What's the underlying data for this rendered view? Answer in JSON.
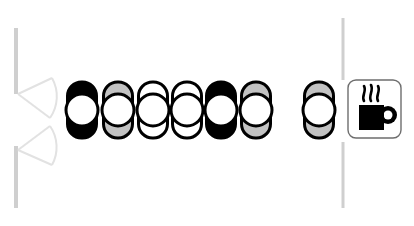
{
  "diagram": {
    "type": "architectural-floor-plan",
    "canvas": {
      "width": 414,
      "height": 226
    },
    "background_color": "#ffffff"
  },
  "colors": {
    "outline": "#000000",
    "seat_filled": "#000000",
    "seat_shaded": "#c2c2c2",
    "seat_empty": "#ffffff",
    "wall": "#cfcfcf",
    "door_arc": "#e2e2e2",
    "box_border": "#6e6e6e",
    "icon": "#000000"
  },
  "walls": {
    "label": "wall segments",
    "segments": [
      {
        "name": "left-wall-upper",
        "x": 16,
        "y1": 28,
        "y2": 94,
        "width": 4,
        "color": "#cfcfcf"
      },
      {
        "name": "left-wall-lower",
        "x": 16,
        "y1": 146,
        "y2": 208,
        "width": 4,
        "color": "#cfcfcf"
      },
      {
        "name": "right-wall-upper",
        "x": 343,
        "y1": 18,
        "y2": 80,
        "width": 3,
        "color": "#cfcfcf"
      },
      {
        "name": "right-wall-lower",
        "x": 343,
        "y1": 142,
        "y2": 208,
        "width": 3,
        "color": "#cfcfcf"
      }
    ]
  },
  "doors": {
    "label": "double door with swing arcs",
    "count": 2,
    "leaves": [
      {
        "name": "door-leaf-upper",
        "hinge_x": 18,
        "hinge_y": 94,
        "leaf_end_x": 52,
        "leaf_end_y": 78,
        "arc_end_x": 50,
        "arc_end_y": 118
      },
      {
        "name": "door-leaf-lower",
        "hinge_x": 18,
        "hinge_y": 150,
        "leaf_end_x": 52,
        "leaf_end_y": 165,
        "arc_end_x": 50,
        "arc_end_y": 126
      }
    ]
  },
  "seating": {
    "label": "Seating row",
    "total_seats": 7,
    "occupied_count": 2,
    "shaded_count": 3,
    "empty_count": 2,
    "seat_geometry": {
      "body_width": 29,
      "body_height": 56,
      "body_radius": 14,
      "head_radius": 16,
      "stroke": 3
    },
    "seats": [
      {
        "id": 1,
        "name": "seat-1",
        "cx": 82,
        "cy": 110,
        "fill": "#000000",
        "state": "occupied"
      },
      {
        "id": 2,
        "name": "seat-2",
        "cx": 118,
        "cy": 110,
        "fill": "#c2c2c2",
        "state": "shaded"
      },
      {
        "id": 3,
        "name": "seat-3",
        "cx": 153,
        "cy": 110,
        "fill": "#ffffff",
        "state": "empty"
      },
      {
        "id": 4,
        "name": "seat-4",
        "cx": 187,
        "cy": 110,
        "fill": "#ffffff",
        "state": "empty"
      },
      {
        "id": 5,
        "name": "seat-5",
        "cx": 221,
        "cy": 110,
        "fill": "#000000",
        "state": "occupied"
      },
      {
        "id": 6,
        "name": "seat-6",
        "cx": 256,
        "cy": 110,
        "fill": "#c2c2c2",
        "state": "shaded"
      },
      {
        "id": 7,
        "name": "seat-7",
        "cx": 319,
        "cy": 110,
        "fill": "#c2c2c2",
        "state": "shaded"
      }
    ]
  },
  "coffee_station": {
    "name": "coffee-station",
    "label": "Coffee station",
    "icon": "coffee-cup-icon",
    "box": {
      "x": 348,
      "y": 80,
      "width": 53,
      "height": 58,
      "radius": 8,
      "border_color": "#6e6e6e",
      "fill": "#ffffff"
    },
    "cup": {
      "body_x": 359,
      "body_y": 105,
      "body_width": 25,
      "body_height": 25,
      "handle_cx": 388,
      "handle_cy": 115,
      "handle_outer_r": 9,
      "handle_inner_r": 4.5,
      "color": "#000000"
    },
    "steam": {
      "count": 3,
      "label": "steam wisps",
      "wisps": [
        {
          "x": 364,
          "y_top": 86,
          "y_bottom": 101
        },
        {
          "x": 371,
          "y_top": 85,
          "y_bottom": 101
        },
        {
          "x": 378,
          "y_top": 86,
          "y_bottom": 101
        }
      ]
    }
  }
}
